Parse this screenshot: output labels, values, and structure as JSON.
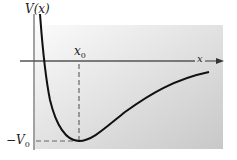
{
  "diagram": {
    "y_axis_label": "V(x)",
    "x_axis_label": "x",
    "x_marker_label": "x0",
    "x_marker_label_base": "x",
    "x_marker_label_sub": "0",
    "y_marker_label": "−V0",
    "y_marker_label_base": "−V",
    "y_marker_label_sub": "0",
    "colors": {
      "curve": "#111111",
      "axis": "#444444",
      "dashed": "#555555",
      "background_light": "#fafafa",
      "background_dark": "#c9c9c9"
    }
  }
}
